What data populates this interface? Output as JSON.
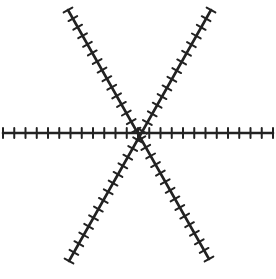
{
  "figure": {
    "stroke_color": "#222222",
    "background": "#ffffff",
    "center": [
      140,
      133
    ],
    "lines": [
      {
        "name": "horizontal",
        "from": [
          3,
          133
        ],
        "to": [
          273,
          133
        ],
        "tick_spacing": 11.3
      },
      {
        "name": "diagonal-down-right",
        "from": [
          68,
          10
        ],
        "to": [
          209,
          259
        ],
        "tick_spacing": 10
      },
      {
        "name": "diagonal-up-right",
        "from": [
          69,
          261
        ],
        "to": [
          211,
          10
        ],
        "tick_spacing": 10
      }
    ],
    "tick_length": 10,
    "line_width": 2.6
  }
}
